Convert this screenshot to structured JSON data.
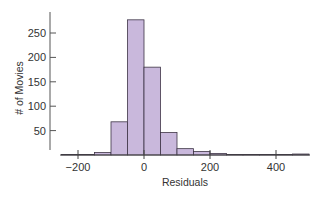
{
  "chart_data": {
    "type": "bar",
    "subtype": "histogram",
    "title": "",
    "xlabel": "Residuals",
    "ylabel": "# of Movies",
    "bin_width": 50,
    "bins": [
      {
        "start": -250,
        "end": -200,
        "count": 1
      },
      {
        "start": -200,
        "end": -150,
        "count": 1
      },
      {
        "start": -150,
        "end": -100,
        "count": 5
      },
      {
        "start": -100,
        "end": -50,
        "count": 68
      },
      {
        "start": -50,
        "end": 0,
        "count": 277
      },
      {
        "start": 0,
        "end": 50,
        "count": 180
      },
      {
        "start": 50,
        "end": 100,
        "count": 46
      },
      {
        "start": 100,
        "end": 150,
        "count": 13
      },
      {
        "start": 150,
        "end": 200,
        "count": 7
      },
      {
        "start": 200,
        "end": 250,
        "count": 3
      },
      {
        "start": 250,
        "end": 300,
        "count": 1
      },
      {
        "start": 300,
        "end": 350,
        "count": 1
      },
      {
        "start": 350,
        "end": 400,
        "count": 1
      },
      {
        "start": 400,
        "end": 450,
        "count": 1
      },
      {
        "start": 450,
        "end": 500,
        "count": 2
      }
    ],
    "categories": [
      "-250",
      "-200",
      "-150",
      "-100",
      "-50",
      "0",
      "50",
      "100",
      "150",
      "200",
      "250",
      "300",
      "350",
      "400",
      "450"
    ],
    "values": [
      1,
      1,
      5,
      68,
      277,
      180,
      46,
      13,
      7,
      3,
      1,
      1,
      1,
      1,
      2
    ],
    "xticks": [
      -200,
      0,
      200,
      400
    ],
    "xtick_labels": [
      "−200",
      "0",
      "200",
      "400"
    ],
    "yticks": [
      50,
      100,
      150,
      200,
      250
    ],
    "ytick_labels": [
      "50",
      "100",
      "150",
      "200",
      "250"
    ],
    "xlim": [
      -250,
      500
    ],
    "ylim": [
      0,
      290
    ],
    "grid": false,
    "legend": null,
    "colors": {
      "bar_fill": "#c9b8dc",
      "bar_edge": "#3d3445",
      "axis": "#444444"
    }
  }
}
